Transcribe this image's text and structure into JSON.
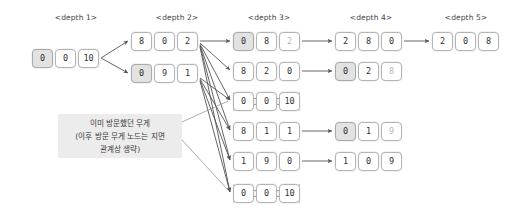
{
  "figure": {
    "title_visible": false,
    "background_color": "#ffffff",
    "highlight_color": "#e2e2e2",
    "border_color": "#b4b4b4",
    "arrow_color": "#555555",
    "note_background": "#ececec"
  },
  "depth_labels": [
    {
      "name": "depth-label-1",
      "text": "<depth 1>",
      "x": 76,
      "y": 13
    },
    {
      "name": "depth-label-2",
      "text": "<depth 2>",
      "x": 177,
      "y": 13
    },
    {
      "name": "depth-label-3",
      "text": "<depth 3>",
      "x": 269,
      "y": 13
    },
    {
      "name": "depth-label-4",
      "text": "<depth 4>",
      "x": 371,
      "y": 13
    },
    {
      "name": "depth-label-5",
      "text": "<depth 5>",
      "x": 466,
      "y": 13
    }
  ],
  "annotation": {
    "line1": "이미 방문했던 무게",
    "line2": "(이후 방문 무게 노드는 지면",
    "line3": "관계상 생략)"
  },
  "nodes": {
    "d1": [
      {
        "id": "depth1-node1",
        "x": 32,
        "y": 49,
        "cells": [
          {
            "value": "0",
            "highlight": true,
            "faded": false
          },
          {
            "value": "0",
            "highlight": false,
            "faded": false
          },
          {
            "value": "10",
            "highlight": false,
            "faded": false
          }
        ],
        "crossed": false
      }
    ],
    "d2": [
      {
        "id": "depth2-node1",
        "x": 131,
        "y": 32,
        "cells": [
          {
            "value": "8",
            "highlight": false,
            "faded": false
          },
          {
            "value": "0",
            "highlight": false,
            "faded": false
          },
          {
            "value": "2",
            "highlight": false,
            "faded": false
          }
        ],
        "crossed": false
      },
      {
        "id": "depth2-node2",
        "x": 131,
        "y": 64,
        "cells": [
          {
            "value": "0",
            "highlight": true,
            "faded": false
          },
          {
            "value": "9",
            "highlight": false,
            "faded": false
          },
          {
            "value": "1",
            "highlight": false,
            "faded": false
          }
        ],
        "crossed": false
      }
    ],
    "d3": [
      {
        "id": "depth3-node1",
        "x": 233,
        "y": 32,
        "cells": [
          {
            "value": "0",
            "highlight": true,
            "faded": false
          },
          {
            "value": "8",
            "highlight": false,
            "faded": false
          },
          {
            "value": "2",
            "highlight": false,
            "faded": true
          }
        ],
        "crossed": false
      },
      {
        "id": "depth3-node2",
        "x": 233,
        "y": 62,
        "cells": [
          {
            "value": "8",
            "highlight": false,
            "faded": false
          },
          {
            "value": "2",
            "highlight": false,
            "faded": false
          },
          {
            "value": "0",
            "highlight": false,
            "faded": false
          }
        ],
        "crossed": false
      },
      {
        "id": "depth3-node3",
        "x": 233,
        "y": 92,
        "cells": [
          {
            "value": "0",
            "highlight": false,
            "faded": false
          },
          {
            "value": "0",
            "highlight": false,
            "faded": false
          },
          {
            "value": "10",
            "highlight": false,
            "faded": false
          }
        ],
        "crossed": true
      },
      {
        "id": "depth3-node4",
        "x": 233,
        "y": 122,
        "cells": [
          {
            "value": "8",
            "highlight": false,
            "faded": false
          },
          {
            "value": "1",
            "highlight": false,
            "faded": false
          },
          {
            "value": "1",
            "highlight": false,
            "faded": false
          }
        ],
        "crossed": false
      },
      {
        "id": "depth3-node5",
        "x": 233,
        "y": 152,
        "cells": [
          {
            "value": "1",
            "highlight": false,
            "faded": false
          },
          {
            "value": "9",
            "highlight": false,
            "faded": false
          },
          {
            "value": "0",
            "highlight": false,
            "faded": false
          }
        ],
        "crossed": false
      },
      {
        "id": "depth3-node6",
        "x": 233,
        "y": 184,
        "cells": [
          {
            "value": "0",
            "highlight": false,
            "faded": false
          },
          {
            "value": "0",
            "highlight": false,
            "faded": false
          },
          {
            "value": "10",
            "highlight": false,
            "faded": false
          }
        ],
        "crossed": true
      }
    ],
    "d4": [
      {
        "id": "depth4-node1",
        "x": 335,
        "y": 32,
        "cells": [
          {
            "value": "2",
            "highlight": false,
            "faded": false
          },
          {
            "value": "8",
            "highlight": false,
            "faded": false
          },
          {
            "value": "0",
            "highlight": false,
            "faded": false
          }
        ],
        "crossed": false
      },
      {
        "id": "depth4-node2",
        "x": 335,
        "y": 62,
        "cells": [
          {
            "value": "0",
            "highlight": true,
            "faded": false
          },
          {
            "value": "2",
            "highlight": false,
            "faded": false
          },
          {
            "value": "8",
            "highlight": false,
            "faded": true
          }
        ],
        "crossed": false
      },
      {
        "id": "depth4-node3",
        "x": 335,
        "y": 122,
        "cells": [
          {
            "value": "0",
            "highlight": true,
            "faded": false
          },
          {
            "value": "1",
            "highlight": false,
            "faded": false
          },
          {
            "value": "9",
            "highlight": false,
            "faded": true
          }
        ],
        "crossed": false
      },
      {
        "id": "depth4-node4",
        "x": 335,
        "y": 152,
        "cells": [
          {
            "value": "1",
            "highlight": false,
            "faded": false
          },
          {
            "value": "0",
            "highlight": false,
            "faded": false
          },
          {
            "value": "9",
            "highlight": false,
            "faded": false
          }
        ],
        "crossed": false
      }
    ],
    "d5": [
      {
        "id": "depth5-node1",
        "x": 432,
        "y": 32,
        "cells": [
          {
            "value": "2",
            "highlight": false,
            "faded": false
          },
          {
            "value": "0",
            "highlight": false,
            "faded": false
          },
          {
            "value": "8",
            "highlight": false,
            "faded": false
          }
        ],
        "crossed": false
      }
    ]
  },
  "edges": [
    {
      "name": "edge-d1-d2a",
      "from": [
        101,
        58
      ],
      "to": [
        128,
        41
      ]
    },
    {
      "name": "edge-d1-d2b",
      "from": [
        101,
        58
      ],
      "to": [
        128,
        73
      ]
    },
    {
      "name": "edge-d2a-d3a",
      "from": [
        200,
        41
      ],
      "to": [
        230,
        41
      ]
    },
    {
      "name": "edge-d2a-d3b",
      "from": [
        200,
        43
      ],
      "to": [
        230,
        70
      ]
    },
    {
      "name": "edge-d2a-d3c",
      "from": [
        200,
        44
      ],
      "to": [
        230,
        100
      ]
    },
    {
      "name": "edge-d2a-d3d",
      "from": [
        200,
        45
      ],
      "to": [
        230,
        130
      ]
    },
    {
      "name": "edge-d2a-d3e",
      "from": [
        200,
        46
      ],
      "to": [
        230,
        160
      ]
    },
    {
      "name": "edge-d2a-d3f",
      "from": [
        200,
        47
      ],
      "to": [
        230,
        192
      ]
    },
    {
      "name": "edge-d2b-d3c",
      "from": [
        200,
        78
      ],
      "to": [
        230,
        100
      ]
    },
    {
      "name": "edge-d2b-d3d",
      "from": [
        200,
        79
      ],
      "to": [
        230,
        130
      ]
    },
    {
      "name": "edge-d2b-d3e",
      "from": [
        200,
        80
      ],
      "to": [
        230,
        160
      ]
    },
    {
      "name": "edge-d2b-d3f",
      "from": [
        200,
        81
      ],
      "to": [
        230,
        192
      ]
    },
    {
      "name": "edge-d3a-d4a",
      "from": [
        302,
        41
      ],
      "to": [
        332,
        41
      ]
    },
    {
      "name": "edge-d3b-d4b",
      "from": [
        302,
        71
      ],
      "to": [
        332,
        71
      ]
    },
    {
      "name": "edge-d3d-d4c",
      "from": [
        302,
        131
      ],
      "to": [
        332,
        131
      ]
    },
    {
      "name": "edge-d3e-d4d",
      "from": [
        302,
        161
      ],
      "to": [
        332,
        161
      ]
    },
    {
      "name": "edge-d4a-d5a",
      "from": [
        404,
        41
      ],
      "to": [
        429,
        41
      ]
    },
    {
      "name": "edge-note-d3c",
      "from": [
        182,
        122
      ],
      "to": [
        228,
        101
      ]
    },
    {
      "name": "edge-note-d3f",
      "from": [
        182,
        140
      ],
      "to": [
        228,
        190
      ]
    }
  ],
  "note_box": {
    "x": 58,
    "y": 114,
    "width": 124,
    "height": 44
  }
}
